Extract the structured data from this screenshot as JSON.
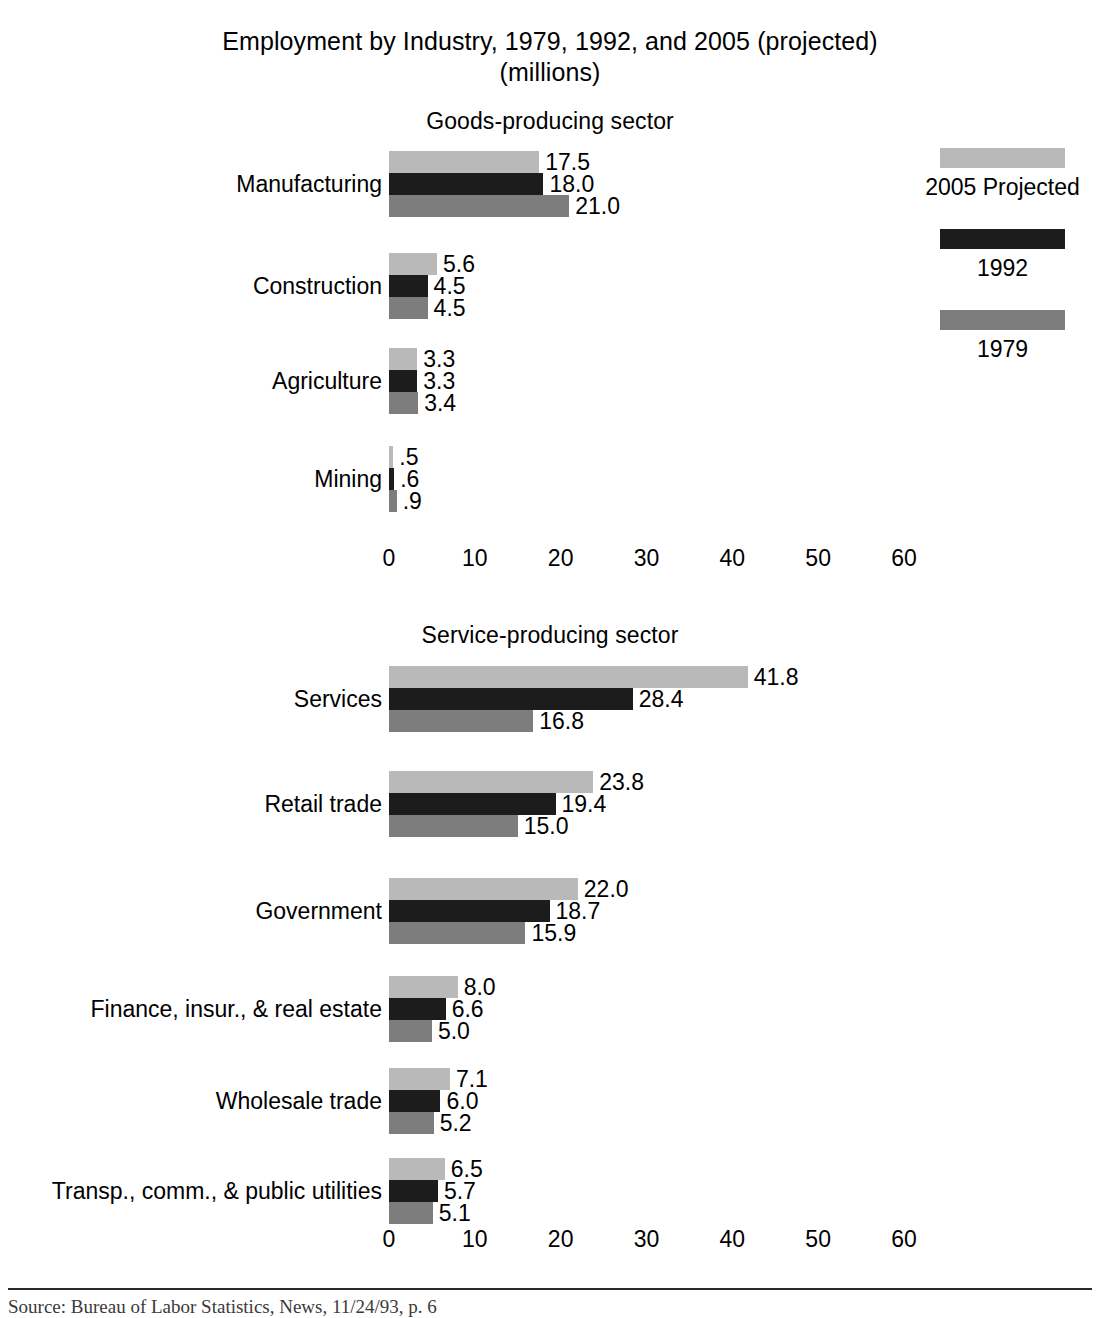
{
  "title": {
    "line1": "Employment by Industry, 1979, 1992, and 2005 (projected)",
    "line2": "(millions)"
  },
  "sections": {
    "goods": "Goods-producing sector",
    "service": "Service-producing sector"
  },
  "legend": {
    "items": [
      {
        "label": "2005 Projected",
        "color": "#b9b9b9",
        "key": "s2005"
      },
      {
        "label": "1992",
        "color": "#1c1c1c",
        "key": "s1992"
      },
      {
        "label": "1979",
        "color": "#7d7d7d",
        "key": "s1979"
      }
    ]
  },
  "axis": {
    "ticks": [
      "0",
      "10",
      "20",
      "30",
      "40",
      "50",
      "60"
    ],
    "min": 0,
    "max": 60,
    "step": 10
  },
  "source": {
    "text": "Source:  Bureau of Labor Statistics, News, 11/24/93, p. 6"
  },
  "chart_data": {
    "type": "bar",
    "orientation": "horizontal",
    "title": "Employment by Industry, 1979, 1992, and 2005 (projected) (millions)",
    "xlabel": "",
    "ylabel": "",
    "xlim": [
      0,
      60
    ],
    "grid": false,
    "legend_position": "right",
    "series_order": [
      "2005 Projected",
      "1992",
      "1979"
    ],
    "panels": [
      {
        "name": "Goods-producing sector",
        "categories": [
          "Manufacturing",
          "Construction",
          "Agriculture",
          "Mining"
        ],
        "series": [
          {
            "name": "2005 Projected",
            "color": "#b9b9b9",
            "values": [
              17.5,
              5.6,
              3.3,
              0.5
            ],
            "labels": [
              "17.5",
              "5.6",
              "3.3",
              ".5"
            ]
          },
          {
            "name": "1992",
            "color": "#1c1c1c",
            "values": [
              18.0,
              4.5,
              3.3,
              0.6
            ],
            "labels": [
              "18.0",
              "4.5",
              "3.3",
              ".6"
            ]
          },
          {
            "name": "1979",
            "color": "#7d7d7d",
            "values": [
              21.0,
              4.5,
              3.4,
              0.9
            ],
            "labels": [
              "21.0",
              "4.5",
              "3.4",
              ".9"
            ]
          }
        ]
      },
      {
        "name": "Service-producing sector",
        "categories": [
          "Services",
          "Retail trade",
          "Government",
          "Finance, insur., & real estate",
          "Wholesale trade",
          "Transp., comm., & public utilities"
        ],
        "series": [
          {
            "name": "2005 Projected",
            "color": "#b9b9b9",
            "values": [
              41.8,
              23.8,
              22.0,
              8.0,
              7.1,
              6.5
            ],
            "labels": [
              "41.8",
              "23.8",
              "22.0",
              "8.0",
              "7.1",
              "6.5"
            ]
          },
          {
            "name": "1992",
            "color": "#1c1c1c",
            "values": [
              28.4,
              19.4,
              18.7,
              6.6,
              6.0,
              5.7
            ],
            "labels": [
              "28.4",
              "19.4",
              "18.7",
              "6.6",
              "6.0",
              "5.7"
            ]
          },
          {
            "name": "1979",
            "color": "#7d7d7d",
            "values": [
              16.8,
              15.0,
              15.9,
              5.0,
              5.2,
              5.1
            ],
            "labels": [
              "16.8",
              "15.0",
              "15.9",
              "5.0",
              "5.2",
              "5.1"
            ]
          }
        ]
      }
    ]
  }
}
